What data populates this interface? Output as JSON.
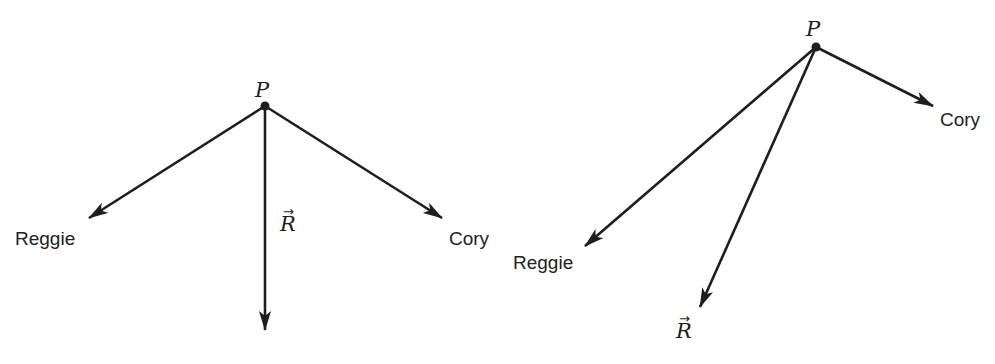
{
  "colors": {
    "background": "#ffffff",
    "stroke": "#1e1e1e",
    "label": "#222222"
  },
  "figures": [
    {
      "id": "left",
      "point": {
        "label": "P",
        "x": 265,
        "y": 106
      },
      "vectors": [
        {
          "name": "Reggie",
          "label": "Reggie",
          "tip": [
            89,
            218
          ],
          "label_pos": [
            15,
            229
          ]
        },
        {
          "name": "Cory",
          "label": "Cory",
          "tip": [
            442,
            218
          ],
          "label_pos": [
            449,
            229
          ]
        },
        {
          "name": "R",
          "label": "R",
          "tip": [
            265,
            330
          ],
          "label_pos": [
            281,
            214
          ],
          "is_vector_symbol": true
        }
      ],
      "point_label_pos": [
        256,
        80
      ]
    },
    {
      "id": "right",
      "point": {
        "label": "P",
        "x": 816,
        "y": 47
      },
      "vectors": [
        {
          "name": "Reggie",
          "label": "Reggie",
          "tip": [
            585,
            246
          ],
          "label_pos": [
            513,
            252
          ]
        },
        {
          "name": "Cory",
          "label": "Cory",
          "tip": [
            933,
            106
          ],
          "label_pos": [
            940,
            110
          ]
        },
        {
          "name": "R",
          "label": "R",
          "tip": [
            700,
            307
          ],
          "label_pos": [
            675,
            322
          ],
          "is_vector_symbol": true
        }
      ],
      "point_label_pos": [
        806,
        20
      ]
    }
  ],
  "labels": {
    "left_P": "P",
    "left_reggie": "Reggie",
    "left_cory": "Cory",
    "left_R": "R",
    "left_R_arrow": "→",
    "right_P": "P",
    "right_reggie": "Reggie",
    "right_cory": "Cory",
    "right_R": "R",
    "right_R_arrow": "→"
  }
}
